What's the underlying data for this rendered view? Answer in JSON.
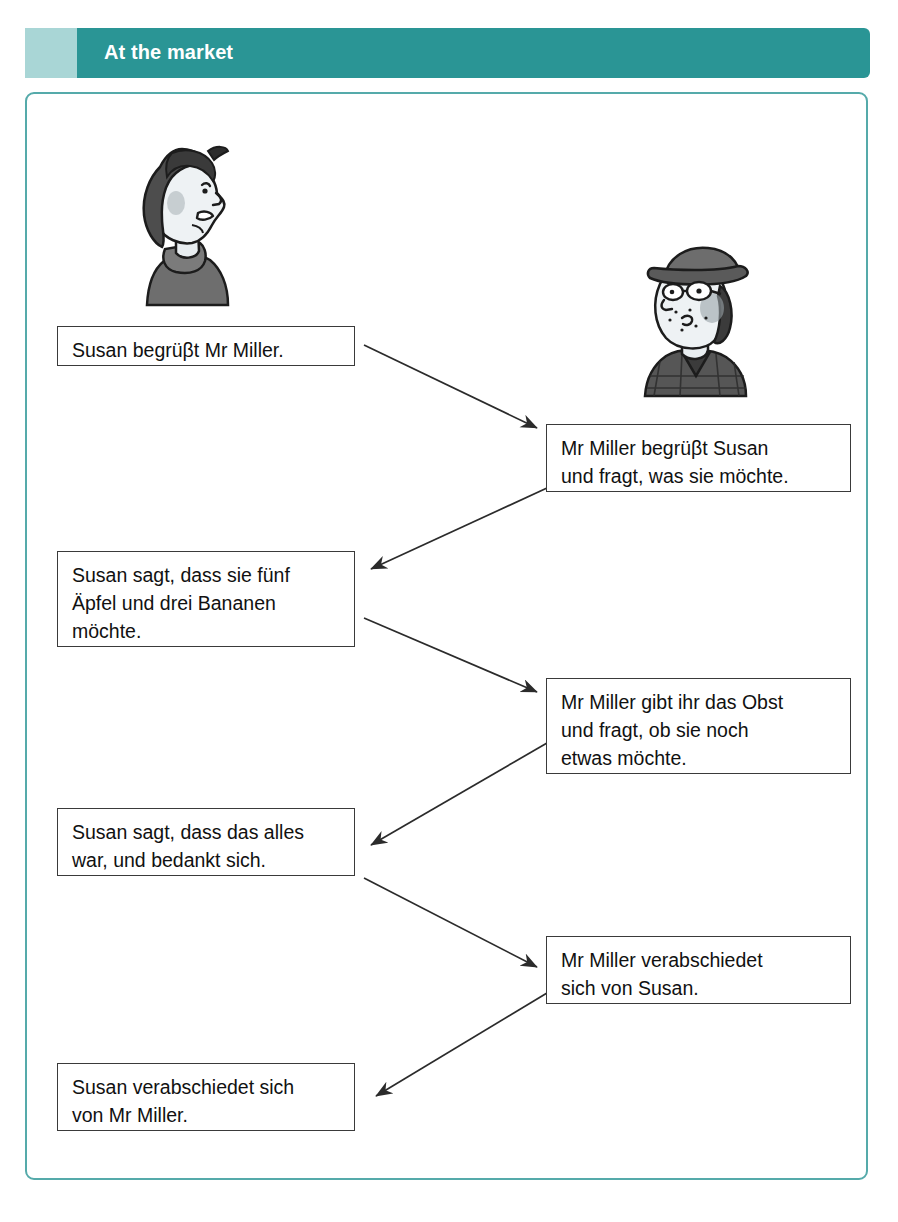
{
  "header": {
    "title": "At the market",
    "bar_color": "#2a9595",
    "tab_color": "#a9d6d6",
    "title_color": "#ffffff"
  },
  "frame": {
    "border_color": "#55aaaa",
    "background": "#ffffff"
  },
  "illustrations": [
    {
      "name": "susan-portrait",
      "alt": "Girl in profile with dark bobbed hair facing right"
    },
    {
      "name": "mr-miller-portrait",
      "alt": "Man with cap, glasses and plaid jacket"
    }
  ],
  "flow": {
    "steps": [
      {
        "id": 1,
        "side": "left",
        "speaker": "Susan",
        "text": "Susan begrüβt Mr Miller."
      },
      {
        "id": 2,
        "side": "right",
        "speaker": "Mr Miller",
        "text": "Mr Miller begrüβt Susan\nund fragt, was sie möchte."
      },
      {
        "id": 3,
        "side": "left",
        "speaker": "Susan",
        "text": "Susan sagt, dass sie fünf\nÄpfel und drei Bananen\nmöchte."
      },
      {
        "id": 4,
        "side": "right",
        "speaker": "Mr Miller",
        "text": "Mr Miller gibt ihr das Obst\nund fragt, ob sie noch\netwas möchte."
      },
      {
        "id": 5,
        "side": "left",
        "speaker": "Susan",
        "text": "Susan sagt, dass das alles\nwar, und bedankt sich."
      },
      {
        "id": 6,
        "side": "right",
        "speaker": "Mr Miller",
        "text": "Mr Miller verabschiedet\nsich von Susan."
      },
      {
        "id": 7,
        "side": "left",
        "speaker": "Susan",
        "text": "Susan verabschiedet sich\nvon Mr Miller."
      }
    ],
    "arrow_color": "#2b2b2b"
  }
}
